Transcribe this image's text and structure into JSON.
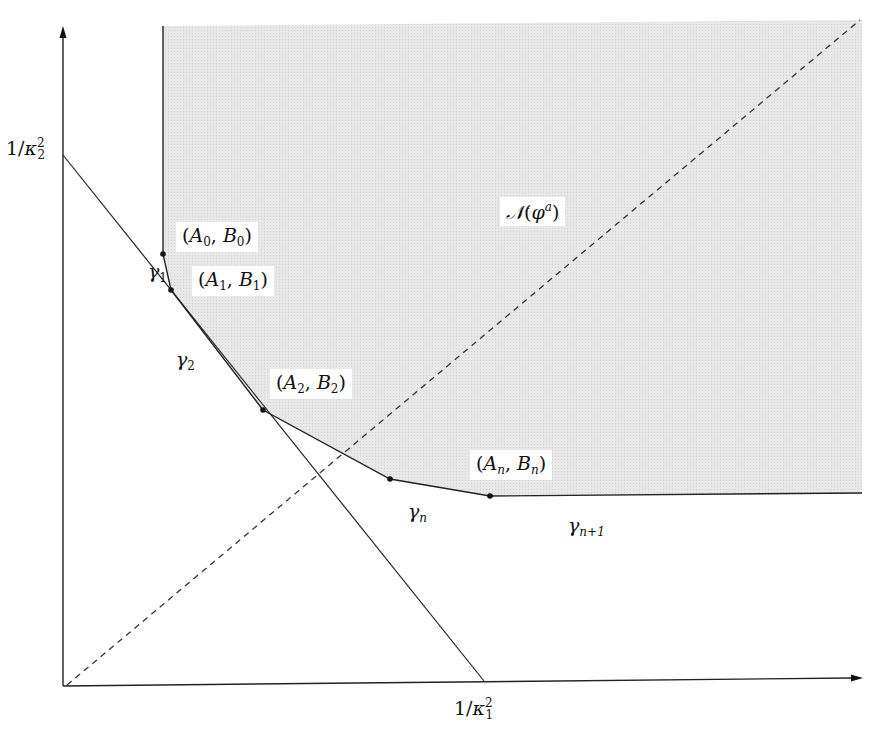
{
  "axes": {
    "x_label": {
      "num": "1/",
      "sym": "κ",
      "sub": "1",
      "sup": "2"
    },
    "y_label": {
      "num": "1/",
      "sym": "κ",
      "sub": "2",
      "sup": "2"
    }
  },
  "region_label": {
    "sym": "𝒩",
    "open": "(",
    "phi": "φ",
    "sup": "a",
    "close": ")"
  },
  "vertices": [
    {
      "name": "A0",
      "A": "A",
      "B": "B",
      "idx": "0"
    },
    {
      "name": "A1",
      "A": "A",
      "B": "B",
      "idx": "1"
    },
    {
      "name": "A2",
      "A": "A",
      "B": "B",
      "idx": "2"
    },
    {
      "name": "An",
      "A": "A",
      "B": "B",
      "idx": "n"
    }
  ],
  "edges": [
    {
      "sym": "γ",
      "sub": "1"
    },
    {
      "sym": "γ",
      "sub": "2"
    },
    {
      "sym": "γ",
      "sub": "n"
    },
    {
      "sym": "γ",
      "sub": "n+1"
    }
  ],
  "colors": {
    "shade": "#e6e6e6",
    "line": "#222222",
    "background": "#ffffff"
  }
}
